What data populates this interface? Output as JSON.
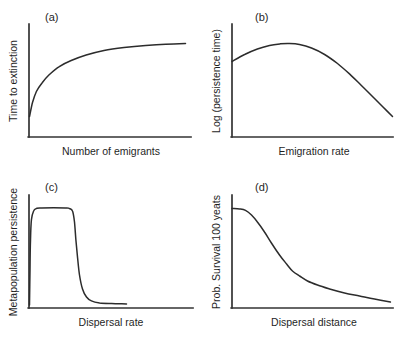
{
  "figure": {
    "background": "#ffffff",
    "line_color": "#333333",
    "curve_color": "#2c2c2c",
    "text_color": "#1f1f1f"
  },
  "chart_data": [
    {
      "panel": "(a)",
      "type": "line",
      "xlabel": "Number of emigrants",
      "ylabel": "Time to extinction",
      "shape": "saturating increase",
      "ticks": "none",
      "grid": false,
      "x_range_norm": [
        0,
        1
      ],
      "y_range_norm": [
        0,
        1
      ],
      "points": [
        [
          0.003,
          0.183
        ],
        [
          0.022,
          0.308
        ],
        [
          0.046,
          0.406
        ],
        [
          0.083,
          0.487
        ],
        [
          0.127,
          0.558
        ],
        [
          0.188,
          0.629
        ],
        [
          0.262,
          0.683
        ],
        [
          0.355,
          0.732
        ],
        [
          0.466,
          0.772
        ],
        [
          0.59,
          0.799
        ],
        [
          0.725,
          0.817
        ],
        [
          0.849,
          0.828
        ],
        [
          0.972,
          0.835
        ]
      ]
    },
    {
      "panel": "(b)",
      "type": "line",
      "xlabel": "Emigration rate",
      "ylabel": "Log (persistence time)",
      "shape": "hump-shaped (unimodal), peak at low-intermediate emigration rate",
      "ticks": "none",
      "grid": false,
      "x_range_norm": [
        0,
        1
      ],
      "y_range_norm": [
        0,
        1
      ],
      "points": [
        [
          0.0,
          0.674
        ],
        [
          0.078,
          0.737
        ],
        [
          0.158,
          0.786
        ],
        [
          0.233,
          0.817
        ],
        [
          0.301,
          0.832
        ],
        [
          0.357,
          0.835
        ],
        [
          0.419,
          0.826
        ],
        [
          0.494,
          0.795
        ],
        [
          0.575,
          0.737
        ],
        [
          0.655,
          0.656
        ],
        [
          0.73,
          0.563
        ],
        [
          0.804,
          0.46
        ],
        [
          0.879,
          0.353
        ],
        [
          0.941,
          0.263
        ],
        [
          0.997,
          0.183
        ]
      ]
    },
    {
      "panel": "(c)",
      "type": "line",
      "xlabel": "Dispersal rate",
      "ylabel": "Metapopulation persistence",
      "shape": "abrupt rise to high plateau then sharp collapse to near zero",
      "ticks": "none",
      "grid": false,
      "x_range_norm": [
        0,
        1
      ],
      "y_range_norm": [
        0,
        1
      ],
      "points": [
        [
          0.003,
          0.027
        ],
        [
          0.006,
          0.339
        ],
        [
          0.009,
          0.607
        ],
        [
          0.015,
          0.786
        ],
        [
          0.028,
          0.866
        ],
        [
          0.046,
          0.888
        ],
        [
          0.077,
          0.893
        ],
        [
          0.224,
          0.893
        ],
        [
          0.248,
          0.888
        ],
        [
          0.267,
          0.866
        ],
        [
          0.279,
          0.768
        ],
        [
          0.288,
          0.607
        ],
        [
          0.298,
          0.446
        ],
        [
          0.31,
          0.295
        ],
        [
          0.328,
          0.17
        ],
        [
          0.353,
          0.098
        ],
        [
          0.383,
          0.063
        ],
        [
          0.433,
          0.045
        ],
        [
          0.506,
          0.04
        ],
        [
          0.598,
          0.036
        ]
      ]
    },
    {
      "panel": "(d)",
      "type": "line",
      "xlabel": "Dispersal distance",
      "ylabel": "Prob. Survival 100 yeats",
      "shape": "monotonic decline, steep at first then long shallow tail",
      "ticks": "none",
      "grid": false,
      "x_range_norm": [
        0,
        1
      ],
      "y_range_norm": [
        0,
        1
      ],
      "points": [
        [
          0.0,
          0.888
        ],
        [
          0.047,
          0.884
        ],
        [
          0.084,
          0.871
        ],
        [
          0.121,
          0.83
        ],
        [
          0.158,
          0.768
        ],
        [
          0.202,
          0.679
        ],
        [
          0.245,
          0.58
        ],
        [
          0.295,
          0.473
        ],
        [
          0.339,
          0.393
        ],
        [
          0.376,
          0.33
        ],
        [
          0.419,
          0.286
        ],
        [
          0.469,
          0.241
        ],
        [
          0.531,
          0.205
        ],
        [
          0.606,
          0.17
        ],
        [
          0.699,
          0.134
        ],
        [
          0.792,
          0.107
        ],
        [
          0.885,
          0.08
        ],
        [
          0.984,
          0.054
        ]
      ]
    }
  ]
}
